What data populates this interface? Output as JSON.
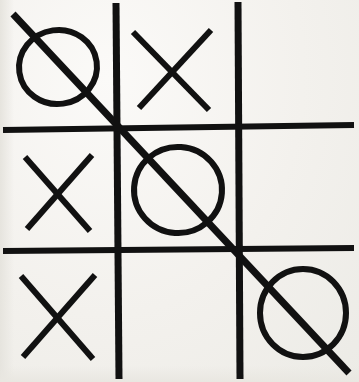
{
  "canvas": {
    "width": 359,
    "height": 382
  },
  "colors": {
    "ink": "#111111",
    "paper": "#f3f1ed",
    "paper_highlight": "#fbfaf8",
    "paper_shadow": "#e6e4de"
  },
  "board": {
    "name": "tic-tac-toe-grid",
    "rows": 3,
    "columns": 3,
    "row_labels": [
      "top",
      "middle",
      "bottom"
    ],
    "column_labels": [
      "left",
      "center",
      "right"
    ],
    "cells": [
      {
        "id": "cell-top-left",
        "row": 0,
        "col": 0,
        "mark": "O",
        "label": "O"
      },
      {
        "id": "cell-top-center",
        "row": 0,
        "col": 1,
        "mark": "X",
        "label": "X"
      },
      {
        "id": "cell-top-right",
        "row": 0,
        "col": 2,
        "mark": "",
        "label": ""
      },
      {
        "id": "cell-middle-left",
        "row": 1,
        "col": 0,
        "mark": "X",
        "label": "X"
      },
      {
        "id": "cell-middle-center",
        "row": 1,
        "col": 1,
        "mark": "O",
        "label": "O"
      },
      {
        "id": "cell-middle-right",
        "row": 1,
        "col": 2,
        "mark": "",
        "label": ""
      },
      {
        "id": "cell-bottom-left",
        "row": 2,
        "col": 0,
        "mark": "X",
        "label": "X"
      },
      {
        "id": "cell-bottom-center",
        "row": 2,
        "col": 1,
        "mark": "",
        "label": ""
      },
      {
        "id": "cell-bottom-right",
        "row": 2,
        "col": 2,
        "mark": "O",
        "label": "O"
      }
    ],
    "winner": "O",
    "winning_line": "diagonal-top-left-to-bottom-right"
  },
  "geometry": {
    "grid_lines": [
      {
        "name": "vertical-left",
        "orientation": "vertical",
        "x1": 116,
        "y1": 3,
        "x2": 119,
        "y2": 379,
        "width": 7
      },
      {
        "name": "vertical-right",
        "orientation": "vertical",
        "x1": 238,
        "y1": 2,
        "x2": 240,
        "y2": 379,
        "width": 7
      },
      {
        "name": "horizontal-upper",
        "orientation": "horizontal",
        "x1": 3,
        "y1": 130,
        "x2": 354,
        "y2": 125,
        "width": 6
      },
      {
        "name": "horizontal-lower",
        "orientation": "horizontal",
        "x1": 3,
        "y1": 251,
        "x2": 354,
        "y2": 248,
        "width": 6
      }
    ],
    "strike_through": {
      "name": "winning-strike",
      "x1": 13,
      "y1": 14,
      "x2": 349,
      "y2": 373,
      "width": 7
    },
    "o_marks": [
      {
        "name": "o-top-left",
        "cx": 58,
        "cy": 67,
        "rx": 39,
        "ry": 37,
        "rotate": -8,
        "width": 6
      },
      {
        "name": "o-middle-center",
        "cx": 178,
        "cy": 190,
        "rx": 44,
        "ry": 43,
        "rotate": 4,
        "width": 6
      },
      {
        "name": "o-bottom-right",
        "cx": 303,
        "cy": 313,
        "rx": 43,
        "ry": 44,
        "rotate": 0,
        "width": 6
      }
    ],
    "x_marks": [
      {
        "name": "x-top-center",
        "stroke1": {
          "x1": 133,
          "y1": 32,
          "x2": 209,
          "y2": 110
        },
        "stroke2": {
          "x1": 211,
          "y1": 30,
          "x2": 139,
          "y2": 108
        },
        "width": 6
      },
      {
        "name": "x-middle-left",
        "stroke1": {
          "x1": 25,
          "y1": 157,
          "x2": 90,
          "y2": 231
        },
        "stroke2": {
          "x1": 92,
          "y1": 155,
          "x2": 27,
          "y2": 229
        },
        "width": 6
      },
      {
        "name": "x-bottom-left",
        "stroke1": {
          "x1": 21,
          "y1": 276,
          "x2": 93,
          "y2": 359
        },
        "stroke2": {
          "x1": 95,
          "y1": 275,
          "x2": 23,
          "y2": 357
        },
        "width": 6
      }
    ]
  }
}
